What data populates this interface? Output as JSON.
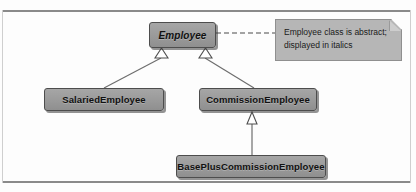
{
  "diagram": {
    "type": "uml-class-diagram",
    "title": "",
    "colors": {
      "class_box_fill": "#9c9c9c",
      "class_box_border": "#4d4d4d",
      "note_fill": "#b6b6b6",
      "note_border": "#8f8f8f",
      "connector": "#6e6e6e",
      "frame": "#8a8a8a",
      "background": "#fdfdfd"
    },
    "classes": [
      {
        "id": "employee",
        "name": "Employee",
        "abstract": true,
        "style": "italic-bold"
      },
      {
        "id": "salaried",
        "name": "SalariedEmployee",
        "abstract": false,
        "style": "bold"
      },
      {
        "id": "commission",
        "name": "CommissionEmployee",
        "abstract": false,
        "style": "bold"
      },
      {
        "id": "baseplus",
        "name": "BasePlusCommissionEmployee",
        "abstract": false,
        "style": "bold"
      }
    ],
    "generalizations": [
      {
        "from": "salaried",
        "to": "employee",
        "arrow": "hollow-triangle"
      },
      {
        "from": "commission",
        "to": "employee",
        "arrow": "hollow-triangle"
      },
      {
        "from": "baseplus",
        "to": "commission",
        "arrow": "hollow-triangle"
      }
    ],
    "note": {
      "id": "note-employee-abstract",
      "anchored_to": "employee",
      "link_style": "dashed",
      "lines": [
        "Employee class is abstract;",
        "displayed in italics"
      ]
    }
  }
}
